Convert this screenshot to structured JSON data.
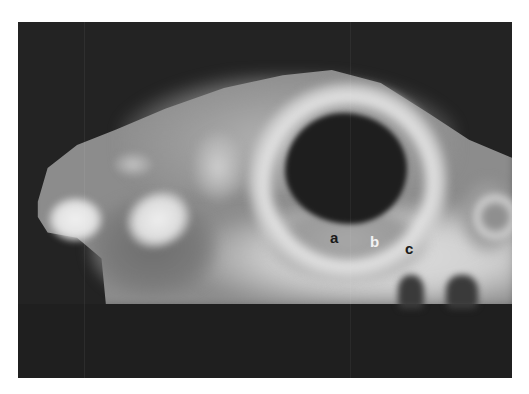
{
  "image": {
    "description": "Grayscale radiograph of a skull in lateral view with a large dark orbit, framed on a black background",
    "background_color": "#ffffff",
    "frame_color": "#232323"
  },
  "labels": [
    {
      "id": "a",
      "text": "a",
      "color": "#1a1a1a"
    },
    {
      "id": "b",
      "text": "b",
      "color": "#f2f2f2"
    },
    {
      "id": "c",
      "text": "c",
      "color": "#1a1a1a"
    }
  ]
}
